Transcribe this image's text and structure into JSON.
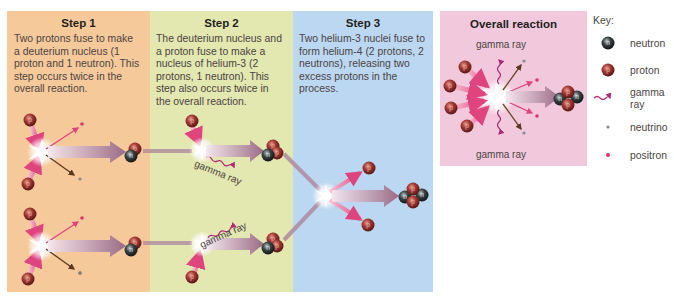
{
  "steps": [
    {
      "title": "Step 1",
      "description_lines": [
        "Two protons fuse to make",
        "a deuterium nucleus (1",
        "proton and 1 neutron). This",
        "step occurs twice in the",
        "overall reaction."
      ],
      "color": "#f6c99a"
    },
    {
      "title": "Step 2",
      "description_lines": [
        "The deuterium nucleus and",
        "a proton fuse to make a",
        "nucleus of helium-3 (2",
        "protons, 1 neutron). This",
        "step also occurs twice in",
        "the overall reaction."
      ],
      "color": "#e3e7b0",
      "labels": [
        "gamma ray",
        "gamma ray"
      ]
    },
    {
      "title": "Step 3",
      "description_lines": [
        "Two helium-3 nuclei fuse to",
        "form helium-4 (2 protons, 2",
        "neutrons), releasing two",
        "excess protons in the",
        "process."
      ],
      "color": "#bcd7f1"
    }
  ],
  "overall": {
    "title": "Overall reaction",
    "top_label": "gamma ray",
    "bottom_label": "gamma ray",
    "color": "#f2c9dc"
  },
  "key": {
    "title": "Key:",
    "items": [
      {
        "icon": "neutron-icon",
        "label": "neutron"
      },
      {
        "icon": "proton-icon",
        "label": "proton"
      },
      {
        "icon": "gamma-ray-icon",
        "label_lines": [
          "gamma",
          "ray"
        ]
      },
      {
        "icon": "neutrino-icon",
        "label": "neutrino"
      },
      {
        "icon": "positron-icon",
        "label": "positron"
      }
    ]
  },
  "particle_glyphs": {
    "proton": "p",
    "neutron": "n"
  },
  "colors": {
    "proton": "#8a2a2a",
    "neutron": "#2e3335",
    "positron": "#e0336a",
    "neutrino": "#8a8a8a",
    "gamma": "#b0287a",
    "arrow_pink": "#e8558c",
    "arrow_brown": "#6b4a2a",
    "big_arrow": "#a0708a"
  }
}
